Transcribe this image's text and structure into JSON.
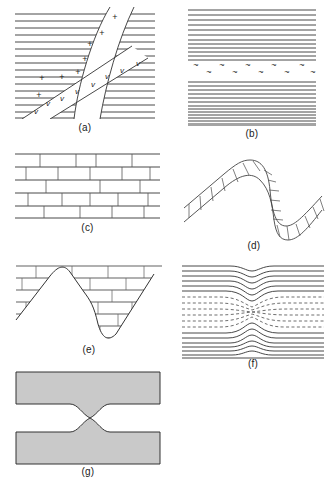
{
  "figure": {
    "background": "#ffffff",
    "line_color": "#333333",
    "fill_gray": "#c9c9c9",
    "width": 333,
    "height": 483
  },
  "panels": [
    {
      "id": "a",
      "label": "(a)",
      "caption": "Cross-cutting igneous dikes in layered strata",
      "x": 14,
      "y": 6,
      "w": 140,
      "h": 112,
      "strata_line_count": 16,
      "dikes": [
        {
          "name": "granite-dike",
          "symbol": "+",
          "symbol_count": 8
        },
        {
          "name": "volcanic-dike",
          "symbol": "v",
          "symbol_count": 8
        }
      ]
    },
    {
      "id": "b",
      "label": "(b)",
      "caption": "Parallel strata separated by a wavy unconformity",
      "x": 186,
      "y": 6,
      "w": 130,
      "h": 104,
      "upper_line_count": 12,
      "lower_line_count": 14,
      "unconformity_symbol": "~",
      "unconformity_rows": 2,
      "unconformity_symbols_per_row": 5
    },
    {
      "id": "c",
      "label": "(c)",
      "caption": "Flat-lying blocky limestone beds",
      "x": 14,
      "y": 152,
      "w": 145,
      "h": 68,
      "brick_rows": 5,
      "brick_columns": 5
    },
    {
      "id": "d",
      "label": "(d)",
      "caption": "Folded blocky bed following an anticline-syncline fold",
      "x": 182,
      "y": 146,
      "w": 142,
      "h": 94,
      "brick_segments": 26
    },
    {
      "id": "e",
      "label": "(e)",
      "caption": "Blocky beds truncated by a folded erosion surface",
      "x": 14,
      "y": 262,
      "w": 145,
      "h": 80,
      "brick_rows": 6,
      "fold_shape": "anticline-syncline"
    },
    {
      "id": "f",
      "label": "(f)",
      "caption": "Necked layers with solid and dashed bedding traces",
      "x": 182,
      "y": 262,
      "w": 140,
      "h": 88,
      "solid_top_count": 6,
      "solid_bottom_count": 7,
      "dashed_count": 10
    },
    {
      "id": "g",
      "label": "(g)",
      "caption": "Shaded layers with downward and upward bulges",
      "x": 14,
      "y": 370,
      "w": 145,
      "h": 98,
      "sublayers": [
        {
          "name": "upper-layer",
          "bulge": "down"
        },
        {
          "name": "lower-layer",
          "bulge": "up"
        }
      ]
    }
  ]
}
